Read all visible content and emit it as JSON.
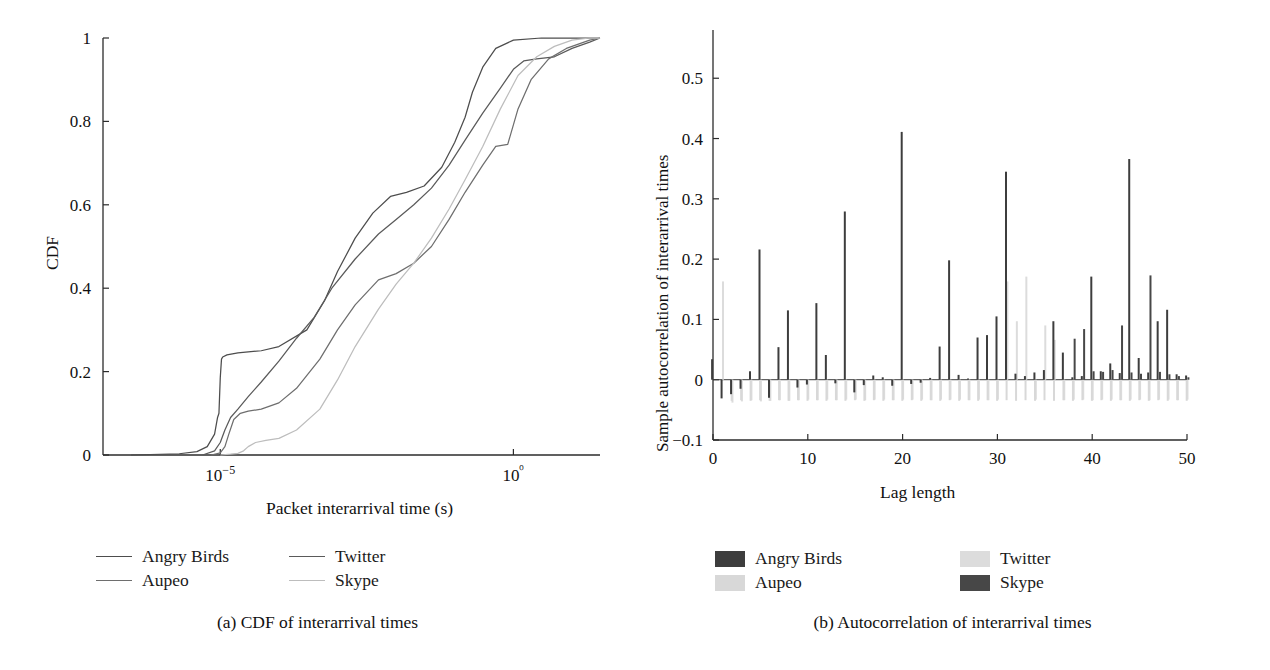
{
  "figure": {
    "panels": [
      {
        "id": "a",
        "caption": "(a)  CDF of interarrival times",
        "legend": [
          {
            "label": "Angry Birds",
            "color": "#4d4d4d",
            "style": "line"
          },
          {
            "label": "Twitter",
            "color": "#5a5a5a",
            "style": "line"
          },
          {
            "label": "Aupeo",
            "color": "#6e6e6e",
            "style": "line"
          },
          {
            "label": "Skype",
            "color": "#bdbdbd",
            "style": "line"
          }
        ]
      },
      {
        "id": "b",
        "caption": "(b)  Autocorrelation of interarrival times",
        "legend": [
          {
            "label": "Angry Birds",
            "color": "#3d3d3d",
            "style": "swatch"
          },
          {
            "label": "Twitter",
            "color": "#dcdcdc",
            "style": "swatch"
          },
          {
            "label": "Aupeo",
            "color": "#d8d8d8",
            "style": "swatch"
          },
          {
            "label": "Skype",
            "color": "#474747",
            "style": "swatch"
          }
        ]
      }
    ]
  },
  "chart_data": [
    {
      "type": "line",
      "title": "",
      "subtitle": "",
      "xlabel": "Packet interarrival time (s)",
      "ylabel": "CDF",
      "xscale": "log",
      "xlim": [
        1e-07,
        30
      ],
      "ylim": [
        0,
        1
      ],
      "xtick_values": [
        1e-05,
        1
      ],
      "xtick_labels": [
        "10−5",
        "10⁰"
      ],
      "ytick_values": [
        0,
        0.2,
        0.4,
        0.6,
        0.8,
        1
      ],
      "ytick_labels": [
        "0",
        "0.2",
        "0.4",
        "0.6",
        "0.8",
        "1"
      ],
      "grid": false,
      "legend_position": "below-left",
      "series": [
        {
          "name": "Angry Birds",
          "color": "#4d4d4d",
          "x": [
            3e-07,
            2e-06,
            4e-06,
            6e-06,
            8e-06,
            9e-06,
            9.5e-06,
            1e-05,
            1.05e-05,
            1.1e-05,
            1.3e-05,
            2e-05,
            5e-05,
            0.0001,
            0.0003,
            0.0006,
            0.001,
            0.002,
            0.004,
            0.008,
            0.015,
            0.03,
            0.06,
            0.1,
            0.15,
            0.2,
            0.3,
            0.5,
            1,
            3,
            10,
            30
          ],
          "y": [
            0,
            0.003,
            0.008,
            0.02,
            0.05,
            0.09,
            0.1,
            0.185,
            0.23,
            0.235,
            0.24,
            0.245,
            0.25,
            0.26,
            0.3,
            0.37,
            0.44,
            0.52,
            0.58,
            0.62,
            0.63,
            0.645,
            0.69,
            0.75,
            0.81,
            0.87,
            0.93,
            0.975,
            0.995,
            1.0,
            1.0,
            1.0
          ]
        },
        {
          "name": "Twitter",
          "color": "#5a5a5a",
          "x": [
            5e-06,
            8e-06,
            1e-05,
            1.2e-05,
            1.5e-05,
            2e-05,
            3e-05,
            5e-05,
            0.0001,
            0.0002,
            0.0004,
            0.0008,
            0.002,
            0.005,
            0.01,
            0.02,
            0.04,
            0.08,
            0.15,
            0.3,
            0.6,
            1.0,
            1.5,
            2.5,
            5,
            10,
            20,
            30
          ],
          "y": [
            0,
            0.01,
            0.03,
            0.06,
            0.09,
            0.11,
            0.14,
            0.175,
            0.225,
            0.28,
            0.33,
            0.4,
            0.47,
            0.53,
            0.565,
            0.6,
            0.64,
            0.695,
            0.755,
            0.82,
            0.88,
            0.925,
            0.945,
            0.95,
            0.955,
            0.975,
            0.99,
            1.0
          ]
        },
        {
          "name": "Aupeo",
          "color": "#6e6e6e",
          "x": [
            7e-06,
            1e-05,
            1.2e-05,
            1.4e-05,
            1.7e-05,
            2.2e-05,
            3e-05,
            5e-05,
            0.0001,
            0.0002,
            0.0005,
            0.001,
            0.002,
            0.005,
            0.01,
            0.02,
            0.04,
            0.08,
            0.15,
            0.3,
            0.5,
            0.8,
            1.2,
            2,
            4,
            8,
            20,
            30
          ],
          "y": [
            0,
            0.005,
            0.02,
            0.05,
            0.085,
            0.1,
            0.105,
            0.11,
            0.125,
            0.16,
            0.23,
            0.3,
            0.36,
            0.42,
            0.435,
            0.46,
            0.5,
            0.565,
            0.63,
            0.695,
            0.74,
            0.745,
            0.83,
            0.9,
            0.95,
            0.975,
            0.995,
            1.0
          ]
        },
        {
          "name": "Skype",
          "color": "#bdbdbd",
          "x": [
            1e-05,
            1.5e-05,
            2e-05,
            2.5e-05,
            3e-05,
            4e-05,
            6e-05,
            0.0001,
            0.0002,
            0.0005,
            0.001,
            0.002,
            0.005,
            0.01,
            0.02,
            0.04,
            0.08,
            0.15,
            0.3,
            0.6,
            1.2,
            2.5,
            5,
            10,
            20,
            30
          ],
          "y": [
            0,
            0.002,
            0.004,
            0.01,
            0.02,
            0.03,
            0.035,
            0.04,
            0.06,
            0.11,
            0.18,
            0.26,
            0.35,
            0.41,
            0.46,
            0.52,
            0.59,
            0.66,
            0.74,
            0.83,
            0.91,
            0.955,
            0.98,
            0.995,
            1.0,
            1.0
          ]
        }
      ]
    },
    {
      "type": "bar",
      "title": "",
      "xlabel": "Lag length",
      "ylabel": "Sample autocorrelation of interarrival times",
      "xlim": [
        0,
        50
      ],
      "ylim": [
        -0.1,
        0.58
      ],
      "xtick_values": [
        0,
        10,
        20,
        30,
        40,
        50
      ],
      "xtick_labels": [
        "0",
        "10",
        "20",
        "30",
        "40",
        "50"
      ],
      "ytick_values": [
        -0.1,
        0,
        0.1,
        0.2,
        0.3,
        0.4,
        0.5
      ],
      "ytick_labels": [
        "−0.1",
        "0",
        "0.1",
        "0.2",
        "0.3",
        "0.4",
        "0.5"
      ],
      "grid": false,
      "legend_position": "below",
      "categories": [
        0,
        1,
        2,
        3,
        4,
        5,
        6,
        7,
        8,
        9,
        10,
        11,
        12,
        13,
        14,
        15,
        16,
        17,
        18,
        19,
        20,
        21,
        22,
        23,
        24,
        25,
        26,
        27,
        28,
        29,
        30,
        31,
        32,
        33,
        34,
        35,
        36,
        37,
        38,
        39,
        40,
        41,
        42,
        43,
        44,
        45,
        46,
        47,
        48,
        49,
        50
      ],
      "series": [
        {
          "name": "Angry Birds",
          "color": "#3d3d3d",
          "values": [
            0.034,
            -0.031,
            -0.024,
            -0.015,
            0.014,
            0.216,
            -0.03,
            0.054,
            0.115,
            -0.013,
            -0.008,
            0.127,
            0.041,
            -0.006,
            0.279,
            -0.021,
            -0.009,
            0.007,
            0.004,
            -0.01,
            0.411,
            -0.007,
            -0.005,
            0.003,
            0.055,
            0.198,
            0.008,
            0.002,
            0.07,
            0.074,
            0.105,
            0.345,
            0.01,
            0.006,
            0.012,
            0.016,
            0.097,
            0.045,
            0.004,
            0.006,
            0.171,
            0.014,
            0.027,
            0.011,
            0.366,
            0.036,
            0.012,
            0.097,
            0.116,
            0.009,
            0.007
          ]
        },
        {
          "name": "Skype",
          "color": "#474747",
          "values": [
            0.0,
            0.0,
            0.0,
            0.0,
            0.0,
            0.0,
            0.0,
            0.0,
            0.0,
            0.0,
            0.0,
            0.0,
            0.0,
            0.0,
            0.0,
            0.0,
            0.0,
            0.0,
            0.0,
            0.0,
            0.0,
            0.0,
            0.0,
            0.0,
            0.0,
            0.0,
            0.0,
            0.0,
            0.0,
            0.0,
            0.0,
            0.0,
            0.0,
            0.0,
            0.0,
            0.0,
            0.0,
            0.0,
            0.068,
            0.084,
            0.014,
            0.013,
            0.016,
            0.09,
            0.012,
            0.01,
            0.173,
            0.013,
            0.009,
            0.006,
            0.004
          ]
        },
        {
          "name": "Twitter",
          "color": "#dcdcdc",
          "values": [
            0.0,
            0.163,
            -0.038,
            -0.036,
            -0.034,
            -0.036,
            -0.035,
            -0.034,
            -0.035,
            -0.034,
            -0.033,
            -0.034,
            -0.033,
            -0.034,
            -0.033,
            -0.033,
            -0.034,
            -0.033,
            -0.033,
            -0.034,
            -0.033,
            -0.033,
            -0.033,
            -0.034,
            -0.033,
            -0.033,
            -0.033,
            -0.034,
            -0.033,
            -0.034,
            -0.033,
            0.163,
            0.097,
            0.171,
            -0.033,
            0.09,
            0.066,
            -0.034,
            -0.033,
            -0.033,
            -0.034,
            -0.033,
            -0.033,
            -0.034,
            -0.033,
            -0.033,
            -0.034,
            -0.033,
            -0.033,
            -0.034,
            -0.033
          ]
        },
        {
          "name": "Aupeo",
          "color": "#d8d8d8",
          "values": [
            0.0,
            0.0,
            -0.035,
            -0.034,
            -0.035,
            -0.034,
            -0.035,
            -0.034,
            -0.035,
            -0.034,
            -0.035,
            -0.034,
            -0.035,
            -0.034,
            -0.035,
            -0.034,
            -0.035,
            -0.034,
            -0.035,
            -0.034,
            -0.035,
            -0.034,
            -0.035,
            -0.034,
            -0.035,
            -0.034,
            -0.035,
            -0.034,
            -0.035,
            -0.034,
            -0.035,
            -0.034,
            -0.035,
            -0.034,
            -0.035,
            -0.034,
            -0.035,
            -0.034,
            -0.035,
            -0.034,
            -0.035,
            -0.034,
            -0.035,
            -0.034,
            -0.035,
            -0.034,
            -0.035,
            -0.034,
            -0.035,
            -0.034,
            -0.035
          ]
        }
      ]
    }
  ]
}
